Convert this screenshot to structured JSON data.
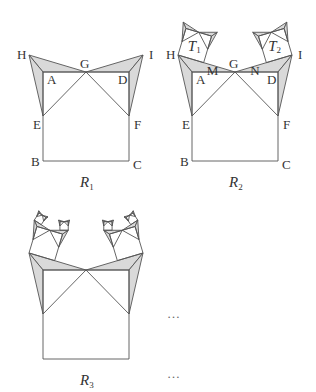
{
  "colors": {
    "stroke": "#555555",
    "shade": "#d9d9d9",
    "background": "#ffffff"
  },
  "base_figure": {
    "points": {
      "A": [
        43,
        72
      ],
      "B": [
        43,
        161
      ],
      "C": [
        129,
        161
      ],
      "D": [
        129,
        72
      ],
      "E": [
        43,
        116
      ],
      "F": [
        129,
        116
      ],
      "G": [
        86,
        72
      ],
      "H": [
        29,
        55
      ],
      "I": [
        143,
        55
      ]
    },
    "child_ratio": 0.45
  },
  "figures": [
    {
      "id": "R1",
      "caption": "R",
      "caption_sub": "1",
      "offset": [
        0,
        0
      ],
      "depth": 0,
      "labels": [
        "H",
        "A",
        "G",
        "D",
        "I",
        "E",
        "F",
        "B",
        "C"
      ]
    },
    {
      "id": "R2",
      "caption": "R",
      "caption_sub": "2",
      "offset": [
        149,
        0
      ],
      "depth": 1,
      "labels": [
        "H",
        "A",
        "G",
        "D",
        "I",
        "E",
        "F",
        "B",
        "C",
        "M",
        "N"
      ],
      "square_labels": [
        {
          "text": "T",
          "sub": "1"
        },
        {
          "text": "T",
          "sub": "2"
        }
      ]
    },
    {
      "id": "R3",
      "caption": "R",
      "caption_sub": "3",
      "offset": [
        0,
        198
      ],
      "depth": 2,
      "labels": []
    }
  ],
  "label_positions": {
    "H": [
      -12,
      4
    ],
    "A": [
      4,
      12
    ],
    "G": [
      -6,
      -4
    ],
    "D": [
      -11,
      12
    ],
    "I": [
      6,
      4
    ],
    "E": [
      -10,
      13
    ],
    "F": [
      5,
      13
    ],
    "B": [
      -12,
      5
    ],
    "C": [
      4,
      8
    ],
    "M": [
      3,
      12
    ],
    "N": [
      -16,
      12
    ]
  },
  "ellipses": [
    {
      "text": "…",
      "pos": [
        174,
        318
      ]
    },
    {
      "text": "…",
      "pos": [
        174,
        378
      ]
    }
  ],
  "captions": {
    "R1": [
      80,
      187
    ],
    "R2": [
      229,
      187
    ],
    "R3": [
      80,
      385
    ]
  }
}
